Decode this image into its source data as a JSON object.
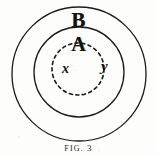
{
  "figure": {
    "caption_label": "Fig.",
    "caption_number": "3",
    "caption_full": "FIG. 3",
    "background_color": "#fdfdfc",
    "ink_color": "#121212",
    "width": 157,
    "height": 156
  },
  "diagram": {
    "type": "nested-circles",
    "shapes": [
      {
        "name": "outer-circle",
        "style": "solid",
        "cx": 79,
        "cy": 74,
        "r": 67,
        "stroke": "#1a1a1a",
        "stroke_width": 1.3
      },
      {
        "name": "middle-circle",
        "style": "solid",
        "cx": 79,
        "cy": 72,
        "r": 45,
        "stroke": "#1a1a1a",
        "stroke_width": 1.3
      },
      {
        "name": "inner-dashed-circle",
        "style": "dashed",
        "cx": 78,
        "cy": 69,
        "r": 26,
        "stroke": "#1a1a1a",
        "stroke_width": 1.6,
        "dash_pattern": "3.2 3.4"
      }
    ]
  },
  "labels": {
    "outer_region": "B",
    "middle_region": "A",
    "inner_point": "x",
    "outer_point": "y"
  }
}
